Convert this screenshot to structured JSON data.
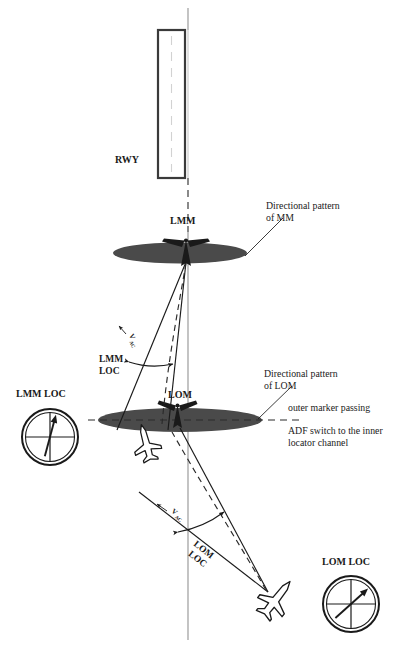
{
  "figure": {
    "type": "diagram"
  },
  "labels": {
    "runway": "RWY",
    "lmm_marker": "LMM",
    "lom_marker": "LOM",
    "directional_pattern_mm_line1": "Directional pattern",
    "directional_pattern_mm_line2": "of MM",
    "directional_pattern_lom_line1": "Directional pattern",
    "directional_pattern_lom_line2": "of LOM",
    "outer_marker_passing": "outer marker passing",
    "adf_switch_line1": "ADF switch to the inner",
    "adf_switch_line2": "locator channel",
    "lmm_loc_line1": "LMM",
    "lmm_loc_line2": "LOC",
    "lom_loc_line1": "LOM",
    "lom_loc_line2": "LOC",
    "v_ac_upper": "V",
    "v_ac_upper_sub": "AC",
    "v_ac_lower": "V",
    "v_ac_lower_sub": "AC"
  },
  "instruments": [
    {
      "id": "lmm-loc-indicator",
      "title": "LMM LOC",
      "needle_angle_deg": 15
    },
    {
      "id": "lom-loc-indicator",
      "title": "LOM LOC",
      "needle_angle_deg": 48
    }
  ],
  "colors": {
    "pattern_fill": "#4a4a4a",
    "line": "#1a1a1a",
    "centerline": "#b5b5b5",
    "dashed": "#2b2b2b",
    "runway_stroke": "#3a3a3a",
    "runway_fill": "#ffffff",
    "text": "#1a1a1a"
  }
}
